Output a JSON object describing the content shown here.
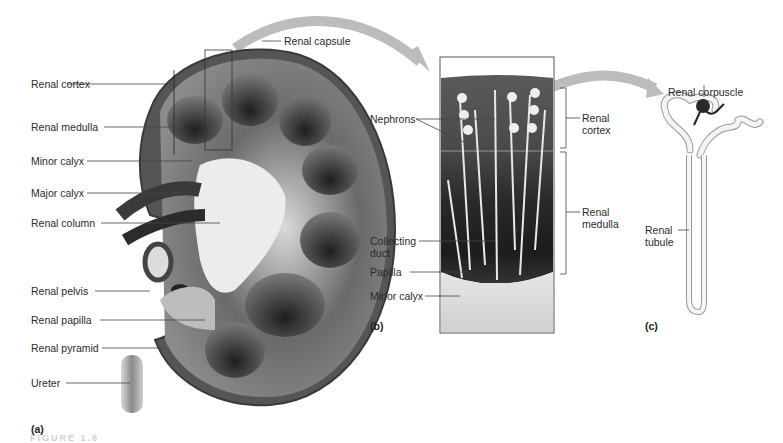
{
  "figure": {
    "panels": [
      {
        "id": "a",
        "tag": "(a)",
        "subject": "Kidney frontal section",
        "labels": [
          "Renal cortex",
          "Renal medulla",
          "Minor calyx",
          "Major calyx",
          "Renal column",
          "Renal pelvis",
          "Renal papilla",
          "Renal pyramid",
          "Ureter",
          "Renal capsule"
        ]
      },
      {
        "id": "b",
        "tag": "(b)",
        "subject": "Enlarged wedge of cortex and medulla",
        "labels": {
          "nephrons": "Nephrons",
          "collecting_duct_line1": "Collecting",
          "collecting_duct_line2": "duct",
          "papilla": "Papilla",
          "minor_calyx": "Minor calyx",
          "renal_cortex_line1": "Renal",
          "renal_cortex_line2": "cortex",
          "renal_medulla_line1": "Renal",
          "renal_medulla_line2": "medulla"
        }
      },
      {
        "id": "c",
        "tag": "(c)",
        "subject": "Single nephron",
        "labels": {
          "renal_corpuscle": "Renal corpuscle",
          "renal_tubule_line1": "Renal",
          "renal_tubule_line2": "tubule"
        }
      }
    ],
    "footer_faint": "FIGURE 1.6"
  },
  "colors": {
    "background": "#ffffff",
    "label_text": "#2b2b2b",
    "leader_line": "#444444",
    "arrow": "#b8b8b8",
    "capsule": "#4a4a4a",
    "cortex": "#8a8a8a",
    "medulla_dark": "#2e2e2e",
    "pelvis_light": "#e8e8e8"
  }
}
